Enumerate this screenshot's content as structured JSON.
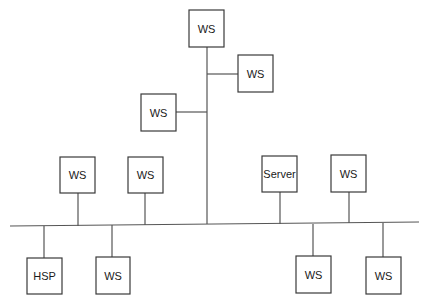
{
  "diagram": {
    "type": "network-topology",
    "colors": {
      "line": "#555555",
      "box_border": "#3a3a3a",
      "text": "#1a1a1a",
      "background": "#ffffff"
    },
    "bus": {
      "x1": 10,
      "y1": 226,
      "x2": 419,
      "y2": 222
    },
    "trunk": {
      "x": 207,
      "y_top": 47,
      "y_bottom": 224
    },
    "nodes": [
      {
        "id": "ws-top",
        "label": "WS",
        "x": 189,
        "y": 10,
        "w": 35,
        "h": 37,
        "link": {
          "x1": 207,
          "y1": 47,
          "x2": 207,
          "y2": 47
        }
      },
      {
        "id": "ws-trunk-right",
        "label": "WS",
        "x": 238,
        "y": 55,
        "w": 35,
        "h": 37,
        "link": {
          "x1": 207,
          "y1": 74,
          "x2": 238,
          "y2": 74
        }
      },
      {
        "id": "ws-trunk-left",
        "label": "WS",
        "x": 141,
        "y": 94,
        "w": 35,
        "h": 37,
        "link": {
          "x1": 176,
          "y1": 112,
          "x2": 207,
          "y2": 112
        }
      },
      {
        "id": "ws-upper-1",
        "label": "WS",
        "x": 60,
        "y": 157,
        "w": 35,
        "h": 36,
        "link": {
          "x1": 78,
          "y1": 193,
          "x2": 78,
          "y2": 226
        }
      },
      {
        "id": "ws-upper-2",
        "label": "WS",
        "x": 128,
        "y": 157,
        "w": 35,
        "h": 36,
        "link": {
          "x1": 145,
          "y1": 193,
          "x2": 145,
          "y2": 225
        }
      },
      {
        "id": "server",
        "label": "Server",
        "x": 262,
        "y": 156,
        "w": 35,
        "h": 36,
        "link": {
          "x1": 280,
          "y1": 192,
          "x2": 280,
          "y2": 224
        }
      },
      {
        "id": "ws-upper-3",
        "label": "WS",
        "x": 331,
        "y": 155,
        "w": 35,
        "h": 37,
        "link": {
          "x1": 349,
          "y1": 192,
          "x2": 349,
          "y2": 223
        }
      },
      {
        "id": "hsp",
        "label": "HSP",
        "x": 27,
        "y": 258,
        "w": 35,
        "h": 36,
        "link": {
          "x1": 44,
          "y1": 226,
          "x2": 44,
          "y2": 258
        }
      },
      {
        "id": "ws-lower-1",
        "label": "WS",
        "x": 96,
        "y": 257,
        "w": 34,
        "h": 37,
        "link": {
          "x1": 112,
          "y1": 225,
          "x2": 112,
          "y2": 257
        }
      },
      {
        "id": "ws-lower-2",
        "label": "WS",
        "x": 296,
        "y": 256,
        "w": 35,
        "h": 37,
        "link": {
          "x1": 313,
          "y1": 224,
          "x2": 313,
          "y2": 256
        }
      },
      {
        "id": "ws-lower-3",
        "label": "WS",
        "x": 366,
        "y": 257,
        "w": 35,
        "h": 37,
        "link": {
          "x1": 383,
          "y1": 223,
          "x2": 383,
          "y2": 257
        }
      }
    ]
  }
}
